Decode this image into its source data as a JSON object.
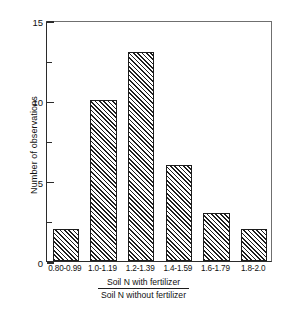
{
  "chart_data": {
    "type": "bar",
    "title": "",
    "subtitle": "",
    "categories": [
      "0.80-0.99",
      "1.0-1.19",
      "1.2-1.39",
      "1.4-1.59",
      "1.6-1.79",
      "1.8-2.0"
    ],
    "values": [
      2,
      10,
      13,
      6,
      3,
      2
    ],
    "xlabel_numerator": "Soil N with fertilizer",
    "xlabel_denominator": "Soil N without fertilizer",
    "ylabel": "Number of observations",
    "ylim": [
      0,
      15
    ],
    "ytick_values": [
      0,
      5,
      10,
      15
    ],
    "ytick_labels": [
      "0",
      "5",
      "10",
      "15"
    ],
    "yminor_tick_values": [
      2.5,
      7.5,
      12.5
    ],
    "grid": false,
    "legend": null,
    "bar_fill": "diagonal-hatch",
    "bar_edge_color": "#1c1c1c",
    "background_color": "#ffffff",
    "axis_color": "#2b2b2b"
  }
}
